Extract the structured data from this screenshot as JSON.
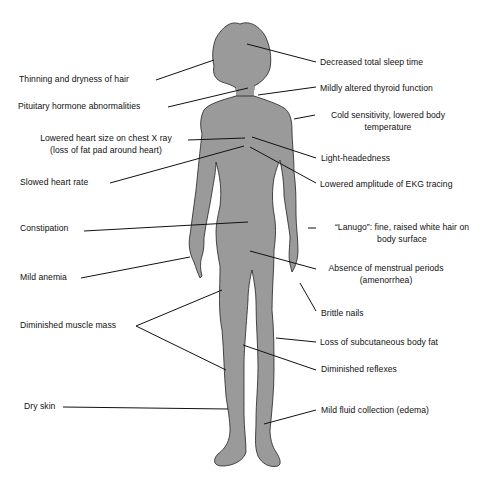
{
  "diagram": {
    "figure": {
      "description": "Silhouette of a female body",
      "fill_color": "#9a9a9a",
      "outline_color": "#222222"
    },
    "left_labels": [
      {
        "id": "hair",
        "lines": [
          "Thinning and dryness of hair"
        ]
      },
      {
        "id": "pituitary",
        "lines": [
          "Pituitary hormone abnormalities"
        ]
      },
      {
        "id": "heart-size",
        "lines": [
          "Lowered heart size on chest X ray",
          "(loss of fat pad around heart)"
        ]
      },
      {
        "id": "heart-rate",
        "lines": [
          "Slowed heart rate"
        ]
      },
      {
        "id": "constipation",
        "lines": [
          "Constipation"
        ]
      },
      {
        "id": "anemia",
        "lines": [
          "Mild anemia"
        ]
      },
      {
        "id": "muscle",
        "lines": [
          "Diminished muscle mass"
        ]
      },
      {
        "id": "dry-skin",
        "lines": [
          "Dry skin"
        ]
      }
    ],
    "right_labels": [
      {
        "id": "sleep",
        "lines": [
          "Decreased total sleep time"
        ]
      },
      {
        "id": "thyroid",
        "lines": [
          "Mildly altered thyroid function"
        ]
      },
      {
        "id": "cold",
        "lines": [
          "Cold sensitivity, lowered body",
          "temperature"
        ]
      },
      {
        "id": "light-headedness",
        "lines": [
          "Light-headedness"
        ]
      },
      {
        "id": "ekg",
        "lines": [
          "Lowered amplitude of EKG tracing"
        ]
      },
      {
        "id": "lanugo",
        "lines": [
          "“Lanugo”: fine, raised white hair on",
          "body surface"
        ]
      },
      {
        "id": "amenorrhea",
        "lines": [
          "Absence of menstrual periods",
          "(amenorrhea)"
        ]
      },
      {
        "id": "nails",
        "lines": [
          "Brittle nails"
        ]
      },
      {
        "id": "subcutaneous-fat",
        "lines": [
          "Loss of subcutaneous body fat"
        ]
      },
      {
        "id": "reflexes",
        "lines": [
          "Diminished reflexes"
        ]
      },
      {
        "id": "edema",
        "lines": [
          "Mild fluid collection (edema)"
        ]
      }
    ]
  }
}
